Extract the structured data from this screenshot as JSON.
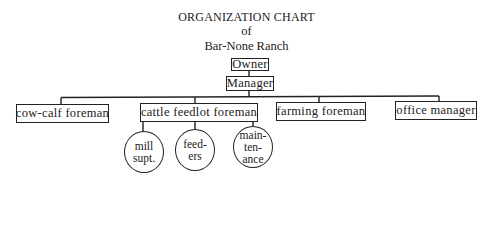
{
  "header": {
    "title": "ORGANIZATION CHART",
    "subtitle_of": "of",
    "subtitle_name": "Bar-None Ranch"
  },
  "nodes": {
    "owner": "Owner",
    "manager": "Manager",
    "cow_calf": "cow-calf foreman",
    "cattle_feedlot": "cattle feedlot foreman",
    "farming": "farming foreman",
    "office": "office manager",
    "mill": [
      "mill",
      "supt."
    ],
    "feeders": [
      "feed-",
      "ers"
    ],
    "maintenance": [
      "main-",
      "ten-",
      "ance"
    ]
  },
  "hierarchy": {
    "Owner": [
      "Manager"
    ],
    "Manager": [
      "cow-calf foreman",
      "cattle feedlot foreman",
      "farming foreman",
      "office manager"
    ],
    "cattle feedlot foreman": [
      "mill supt.",
      "feeders",
      "maintenance"
    ]
  },
  "colors": {
    "ink": "#222222",
    "background": "#ffffff"
  }
}
